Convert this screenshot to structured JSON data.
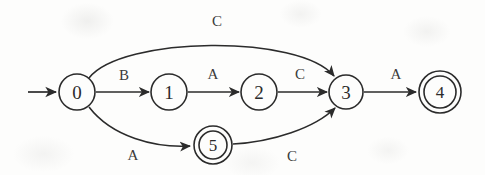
{
  "diagram": {
    "background_color": "#fdfdfc",
    "stroke_color": "#2b2b2b",
    "label_color": "#3a3a3a",
    "states": [
      {
        "id": "s0",
        "label": "0",
        "accepting": false,
        "cx": 77,
        "cy": 92,
        "r": 18
      },
      {
        "id": "s1",
        "label": "1",
        "accepting": false,
        "cx": 169,
        "cy": 92,
        "r": 18
      },
      {
        "id": "s2",
        "label": "2",
        "accepting": false,
        "cx": 259,
        "cy": 92,
        "r": 18
      },
      {
        "id": "s3",
        "label": "3",
        "accepting": false,
        "cx": 346,
        "cy": 92,
        "r": 17
      },
      {
        "id": "s4",
        "label": "4",
        "accepting": true,
        "cx": 440,
        "cy": 92,
        "r": 16,
        "r_outer": 21
      },
      {
        "id": "s5",
        "label": "5",
        "accepting": true,
        "cx": 213,
        "cy": 145,
        "r": 14,
        "r_outer": 19
      }
    ],
    "start_arrow": {
      "from_x": 28,
      "to_x": 57,
      "y": 92
    },
    "transitions": [
      {
        "from": "s0",
        "to": "s1",
        "label": "B",
        "label_x": 124,
        "label_y": 75,
        "shape": "straight"
      },
      {
        "from": "s1",
        "to": "s2",
        "label": "A",
        "label_x": 213,
        "label_y": 74,
        "shape": "straight"
      },
      {
        "from": "s2",
        "to": "s3",
        "label": "C",
        "label_x": 300,
        "label_y": 74,
        "shape": "straight"
      },
      {
        "from": "s3",
        "to": "s4",
        "label": "A",
        "label_x": 396,
        "label_y": 74,
        "shape": "straight"
      },
      {
        "from": "s0",
        "to": "s3",
        "label": "C",
        "label_x": 217,
        "label_y": 21,
        "shape": "arc-above"
      },
      {
        "from": "s0",
        "to": "s5",
        "label": "A",
        "label_x": 133,
        "label_y": 155,
        "shape": "arc-below"
      },
      {
        "from": "s5",
        "to": "s3",
        "label": "C",
        "label_x": 292,
        "label_y": 156,
        "shape": "arc-below"
      }
    ]
  }
}
